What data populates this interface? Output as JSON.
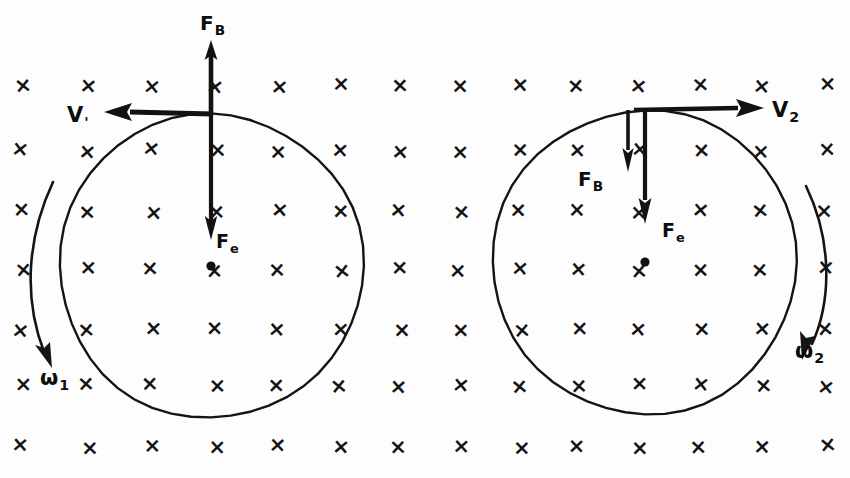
{
  "figure": {
    "background_color": "#fdfdfd",
    "ink_color": "#141414"
  },
  "field": {
    "symbol": "×",
    "meaning_label": "magnetic-field-into-page",
    "columns": 14,
    "rows": 7,
    "column_x": [
      22,
      88,
      152,
      216,
      278,
      340,
      400,
      460,
      520,
      578,
      638,
      700,
      762,
      826
    ],
    "row_y": [
      86,
      151,
      212,
      270,
      330,
      386,
      447
    ]
  },
  "left_body": {
    "name": "sphere-1",
    "center": {
      "x": 211,
      "y": 266
    },
    "radius": 152,
    "center_dot": true,
    "vectors": [
      {
        "id": "f-b-left",
        "label": "F",
        "subscript": "B",
        "direction": "up",
        "label_x": 200,
        "label_y": 30,
        "label_size": 20
      },
      {
        "id": "v-1-left",
        "label": "V",
        "subscript": "'",
        "direction": "left",
        "label_x": 67,
        "label_y": 122,
        "label_size": 21
      },
      {
        "id": "f-e-left",
        "label": "F",
        "subscript": "e",
        "direction": "down",
        "label_x": 216,
        "label_y": 248,
        "label_size": 19
      }
    ],
    "angular_velocity": {
      "label": "ω",
      "subscript": "1",
      "label_x": 40,
      "label_y": 385,
      "label_size": 21,
      "arc_side": "left",
      "arrow_end": "bottom"
    }
  },
  "right_body": {
    "name": "sphere-2",
    "center": {
      "x": 645,
      "y": 262
    },
    "radius": 152,
    "center_dot": true,
    "vectors": [
      {
        "id": "v-2-right",
        "label": "V",
        "subscript": "2",
        "direction": "right",
        "label_x": 772,
        "label_y": 117,
        "label_size": 21
      },
      {
        "id": "f-b-right",
        "label": "F",
        "subscript": "B",
        "direction": "down",
        "label_x": 578,
        "label_y": 186,
        "label_size": 20
      },
      {
        "id": "f-e-right",
        "label": "F",
        "subscript": "e",
        "direction": "down",
        "label_x": 662,
        "label_y": 237,
        "label_size": 19
      }
    ],
    "angular_velocity": {
      "label": "ω",
      "subscript": "2",
      "label_x": 795,
      "label_y": 358,
      "label_size": 21,
      "arc_side": "right",
      "arrow_end": "bottom"
    }
  }
}
